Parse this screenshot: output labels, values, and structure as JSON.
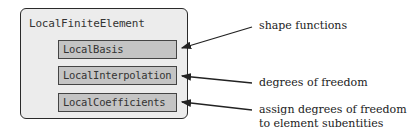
{
  "diagram": {
    "container": {
      "label": "LocalFiniteElement"
    },
    "components": [
      {
        "label": "LocalBasis",
        "description": "shape functions"
      },
      {
        "label": "LocalInterpolation",
        "description": "degrees of freedom"
      },
      {
        "label": "LocalCoefficients",
        "description_line1": "assign degrees of freedom",
        "description_line2": "to element subentities"
      }
    ],
    "colors": {
      "container_fill": "#ececec",
      "component_fill": "#c4c4c4",
      "stroke": "#2a2a2a"
    }
  }
}
